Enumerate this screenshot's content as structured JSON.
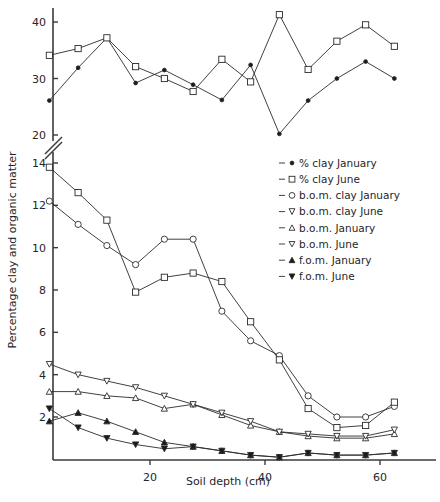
{
  "figure": {
    "ylabel": "Percentage clay and organic matter",
    "xlabel": "Soil depth (cm)"
  },
  "axes": {
    "y_ticks_upper": [
      "40",
      "30",
      "20"
    ],
    "y_ticks_lower": [
      "14",
      "12",
      "10",
      "8",
      "6",
      "4",
      "2"
    ],
    "x_ticks": [
      "20",
      "40",
      "60"
    ],
    "has_axis_break": true
  },
  "legend": {
    "items": [
      {
        "marker": "filled-circle-small",
        "label": "% clay January"
      },
      {
        "marker": "open-square",
        "label": "% clay June"
      },
      {
        "marker": "open-circle",
        "label": "b.o.m. clay January"
      },
      {
        "marker": "open-heart",
        "label": "b.o.m. clay June"
      },
      {
        "marker": "open-triangle-up",
        "label": "b.o.m. January"
      },
      {
        "marker": "open-triangle-down",
        "label": "b.o.m. June"
      },
      {
        "marker": "filled-triangle-up",
        "label": "f.o.m. January"
      },
      {
        "marker": "filled-triangle-down",
        "label": "f.o.m. June"
      }
    ]
  },
  "chart_data": {
    "type": "line",
    "title": "",
    "xlabel": "Soil depth (cm)",
    "ylabel": "Percentage clay and organic matter",
    "xlim": [
      2.5,
      65
    ],
    "x": [
      2.5,
      7.5,
      12.5,
      17.5,
      22.5,
      27.5,
      32.5,
      37.5,
      42.5,
      47.5,
      52.5,
      57.5,
      62.5
    ],
    "axis_break": {
      "lower_range": [
        0,
        14
      ],
      "upper_range": [
        20,
        42
      ]
    },
    "grid": false,
    "legend_position": "right",
    "series": [
      {
        "name": "% clay January",
        "marker": "filled-circle-small",
        "values": [
          26.1,
          31.9,
          37.2,
          29.2,
          31.5,
          28.9,
          26.2,
          32.4,
          20.2,
          26.1,
          30.0,
          33.0,
          30.0
        ]
      },
      {
        "name": "% clay June",
        "marker": "open-square",
        "values": [
          34.1,
          35.3,
          37.2,
          32.1,
          30.0,
          27.7,
          33.4,
          29.4,
          41.3,
          31.6,
          36.6,
          39.5,
          35.7
        ]
      },
      {
        "name": "b.o.m. clay January",
        "marker": "open-circle",
        "values": [
          12.2,
          11.1,
          10.1,
          9.2,
          10.4,
          10.4,
          7.0,
          5.6,
          4.9,
          3.0,
          2.0,
          2.0,
          2.5
        ]
      },
      {
        "name": "b.o.m. clay June",
        "marker": "open-square-lower",
        "values": [
          13.8,
          12.6,
          11.3,
          7.9,
          8.6,
          8.8,
          8.4,
          6.5,
          4.7,
          2.4,
          1.5,
          1.6,
          2.7
        ]
      },
      {
        "name": "b.o.m. January",
        "marker": "open-triangle-up",
        "values": [
          3.2,
          3.2,
          3.0,
          2.9,
          2.4,
          2.6,
          2.1,
          1.6,
          1.3,
          1.1,
          1.0,
          1.0,
          1.2
        ]
      },
      {
        "name": "b.o.m. June",
        "marker": "open-triangle-down",
        "values": [
          4.5,
          4.0,
          3.7,
          3.4,
          3.0,
          2.6,
          2.2,
          1.8,
          1.3,
          1.2,
          1.1,
          1.1,
          1.4
        ]
      },
      {
        "name": "f.o.m. January",
        "marker": "filled-triangle-up",
        "values": [
          1.8,
          2.2,
          1.8,
          1.3,
          0.8,
          0.6,
          0.4,
          0.2,
          0.1,
          0.3,
          0.2,
          0.2,
          0.3
        ]
      },
      {
        "name": "f.o.m. June",
        "marker": "filled-triangle-down",
        "values": [
          2.4,
          1.5,
          1.0,
          0.7,
          0.5,
          0.6,
          0.4,
          0.2,
          0.1,
          0.3,
          0.2,
          0.2,
          0.3
        ]
      }
    ]
  }
}
